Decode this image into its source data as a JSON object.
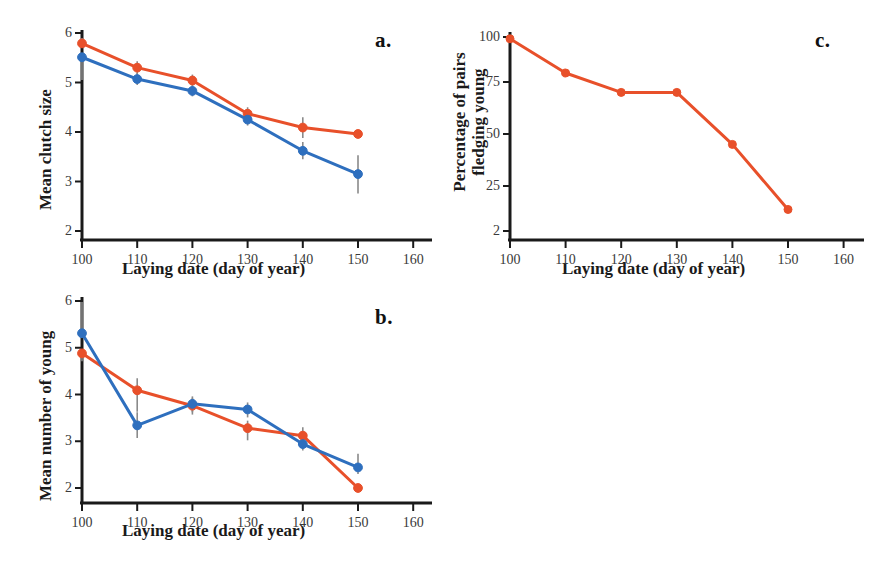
{
  "figure": {
    "background_color": "#ffffff",
    "series_colors": {
      "orange": "#E8502A",
      "blue": "#2E6FBE",
      "errorbar": "#8a8a8a",
      "axis": "#1a1a1a"
    },
    "panels": [
      {
        "letter": "a.",
        "position": "top-left"
      },
      {
        "letter": "b.",
        "position": "bottom-left"
      },
      {
        "letter": "c.",
        "position": "top-right"
      }
    ]
  },
  "chart_data": [
    {
      "id": "panel-a",
      "panel_label": "a.",
      "type": "line",
      "title": "",
      "xlabel": "Laying date (day of year)",
      "ylabel": "Mean clutch size",
      "x": [
        100,
        110,
        120,
        130,
        140,
        150
      ],
      "xticks": [
        100,
        110,
        120,
        130,
        140,
        150,
        160
      ],
      "xticklabels": [
        "100",
        "110",
        "120",
        "130",
        "140",
        "150",
        "160"
      ],
      "yticks": [
        2,
        3,
        4,
        5,
        6
      ],
      "yticklabels": [
        "2",
        "3",
        "4",
        "5",
        "6"
      ],
      "xlim": [
        95,
        165
      ],
      "ylim": [
        1.8,
        6.1
      ],
      "grid": false,
      "legend": "none",
      "series": [
        {
          "name": "orange",
          "color": "#E8502A",
          "values": [
            5.79,
            5.3,
            5.04,
            4.37,
            4.09,
            3.96
          ],
          "err_low": [
            5.79,
            5.17,
            4.93,
            4.25,
            3.88,
            3.96
          ],
          "err_high": [
            5.9,
            5.43,
            5.16,
            4.5,
            4.3,
            3.96
          ]
        },
        {
          "name": "blue",
          "color": "#2E6FBE",
          "values": [
            5.51,
            5.07,
            4.83,
            4.25,
            3.62,
            3.15
          ],
          "err_low": [
            5.05,
            4.95,
            4.72,
            4.13,
            3.45,
            2.76
          ],
          "err_high": [
            5.56,
            5.19,
            4.94,
            4.37,
            3.8,
            3.53
          ]
        }
      ]
    },
    {
      "id": "panel-b",
      "panel_label": "b.",
      "type": "line",
      "title": "",
      "xlabel": "Laying date (day of year)",
      "ylabel": "Mean number of young",
      "x": [
        100,
        110,
        120,
        130,
        140,
        150
      ],
      "xticks": [
        100,
        110,
        120,
        130,
        140,
        150,
        160
      ],
      "xticklabels": [
        "100",
        "110",
        "120",
        "130",
        "140",
        "150",
        "160"
      ],
      "yticks": [
        2,
        3,
        4,
        5,
        6
      ],
      "yticklabels": [
        "2",
        "3",
        "4",
        "5",
        "6"
      ],
      "xlim": [
        95,
        165
      ],
      "ylim": [
        1.8,
        6.1
      ],
      "grid": false,
      "legend": "none",
      "series": [
        {
          "name": "orange",
          "color": "#E8502A",
          "values": [
            4.88,
            4.09,
            3.76,
            3.28,
            3.12,
            2.0
          ],
          "err_low": [
            4.71,
            3.63,
            3.57,
            3.02,
            2.9,
            2.0
          ],
          "err_high": [
            4.95,
            4.35,
            3.93,
            3.44,
            3.3,
            2.0
          ]
        },
        {
          "name": "blue",
          "color": "#2E6FBE",
          "values": [
            5.31,
            3.34,
            3.8,
            3.68,
            2.94,
            2.44
          ],
          "err_low": [
            5.31,
            3.07,
            3.62,
            3.51,
            2.8,
            2.3
          ],
          "err_high": [
            5.98,
            3.62,
            3.96,
            3.83,
            3.13,
            2.73
          ]
        }
      ]
    },
    {
      "id": "panel-c",
      "panel_label": "c.",
      "type": "line",
      "title": "",
      "xlabel": "Laying date (day of year)",
      "ylabel": "Percentage of pairs fledging young",
      "ylabel_line1": "Percentage of pairs",
      "ylabel_line2": "fledging young",
      "x": [
        100,
        110,
        120,
        130,
        140,
        150
      ],
      "xticks": [
        100,
        110,
        120,
        130,
        140,
        150,
        160
      ],
      "xticklabels": [
        "100",
        "110",
        "120",
        "130",
        "140",
        "150",
        "160"
      ],
      "yticks": [
        2,
        25,
        50,
        75,
        100
      ],
      "yticklabels": [
        "2",
        "25",
        "50",
        "75",
        "100"
      ],
      "xlim": [
        95,
        165
      ],
      "grid": false,
      "legend": "none",
      "series": [
        {
          "name": "orange",
          "color": "#E8502A",
          "values": [
            99,
            80,
            70,
            70,
            45,
            13
          ]
        }
      ]
    }
  ]
}
